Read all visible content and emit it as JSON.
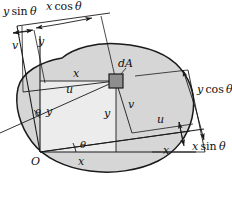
{
  "figure": {
    "type": "engineering-diagram",
    "colors": {
      "area_fill": "#d6d6d6",
      "inner_fill": "#ececec",
      "element_fill": "#8e8e8e",
      "stroke": "#1a1a1a"
    }
  },
  "labels": {
    "origin": "O",
    "axis_x": "x",
    "axis_y": "y",
    "axis_u": "u",
    "axis_v": "v",
    "element": "dA",
    "angle": "θ",
    "coord_x": "x",
    "coord_y": "y",
    "coord_u": "u",
    "coord_v": "v",
    "proj_x_cos": "x cosθ",
    "proj_y_sin": "y sinθ",
    "proj_y_cos": "y cosθ",
    "proj_x_sin": "x sinθ"
  },
  "label_parts": {
    "x": "x",
    "y": "y",
    "u": "u",
    "v": "v",
    "cos": "cos",
    "sin": "sin",
    "theta": "θ",
    "dA_d": "d",
    "dA_A": "A",
    "O": "O"
  }
}
